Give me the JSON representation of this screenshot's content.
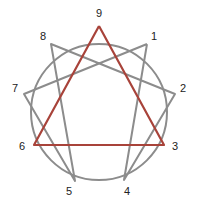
{
  "diagram": {
    "type": "enneagram",
    "center": [
      99,
      112
    ],
    "radius": 68,
    "colors": {
      "circle": "#8c8c8c",
      "hexad": "#8c8c8c",
      "triangle": "#a8433a",
      "label": "#222222",
      "background": "#ffffff"
    },
    "points": [
      {
        "id": "9",
        "label": "9",
        "x": 99,
        "y": 26,
        "lx": 99,
        "ly": 14
      },
      {
        "id": "1",
        "label": "1",
        "x": 147,
        "y": 44,
        "lx": 154,
        "ly": 37
      },
      {
        "id": "2",
        "label": "2",
        "x": 175,
        "y": 94,
        "lx": 183,
        "ly": 89
      },
      {
        "id": "3",
        "label": "3",
        "x": 164,
        "y": 145,
        "lx": 175,
        "ly": 147
      },
      {
        "id": "4",
        "label": "4",
        "x": 124,
        "y": 180,
        "lx": 127,
        "ly": 192
      },
      {
        "id": "5",
        "label": "5",
        "x": 75,
        "y": 181,
        "lx": 69,
        "ly": 192
      },
      {
        "id": "6",
        "label": "6",
        "x": 34,
        "y": 145,
        "lx": 22,
        "ly": 147
      },
      {
        "id": "7",
        "label": "7",
        "x": 24,
        "y": 94,
        "lx": 15,
        "ly": 89
      },
      {
        "id": "8",
        "label": "8",
        "x": 51,
        "y": 44,
        "lx": 43,
        "ly": 37
      }
    ],
    "hexad_sequence": [
      "1",
      "4",
      "2",
      "8",
      "5",
      "7",
      "1"
    ],
    "triangle_sequence": [
      "9",
      "3",
      "6",
      "9"
    ]
  }
}
